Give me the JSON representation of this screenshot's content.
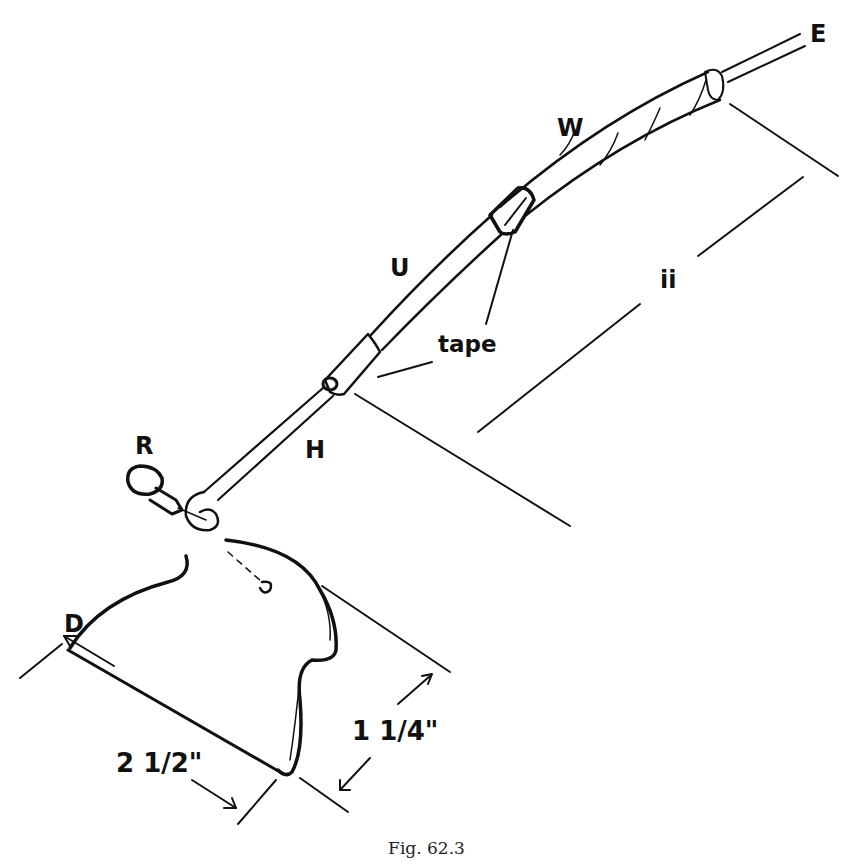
{
  "figure": {
    "caption": "Fig.  62.3",
    "labels": {
      "E": "E",
      "W": "W",
      "U": "U",
      "ii": "ii",
      "tape": "tape",
      "H": "H",
      "R": "R",
      "D": "D",
      "dim_length": "2 1/2\"",
      "dim_width": "1 1/4\""
    },
    "colors": {
      "ink": "#111111",
      "background": "#ffffff"
    }
  }
}
